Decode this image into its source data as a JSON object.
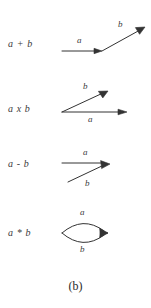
{
  "figure": {
    "caption": "(b)",
    "ink_color": "#333333",
    "background_color": "#ffffff",
    "rows": [
      {
        "id": "addition",
        "operation_label": "a + b",
        "diagram": "head-to-tail-chain",
        "edge_labels": {
          "first": "a",
          "second": "b"
        }
      },
      {
        "id": "multiplication",
        "operation_label": "a x b",
        "diagram": "common-tail-fan",
        "edge_labels": {
          "upper": "b",
          "lower": "a"
        }
      },
      {
        "id": "subtraction",
        "operation_label": "a - b",
        "diagram": "common-head-converge",
        "edge_labels": {
          "upper": "a",
          "lower": "b"
        }
      },
      {
        "id": "star",
        "operation_label": "a * b",
        "diagram": "parallel-lens-loop",
        "edge_labels": {
          "upper": "a",
          "lower": "b"
        }
      }
    ]
  }
}
